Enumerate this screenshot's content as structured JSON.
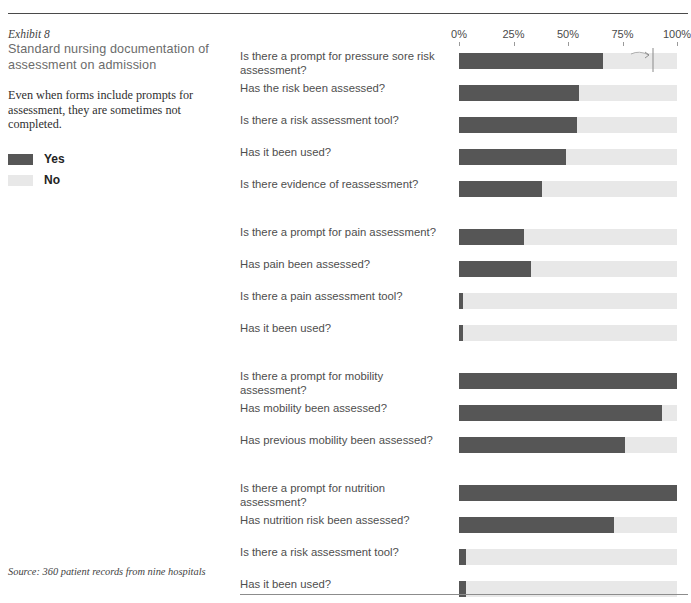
{
  "exhibit": {
    "label": "Exhibit 8",
    "title": "Standard nursing documentation of assessment on admission",
    "description": "Even when forms include prompts for assessment, they are sometimes not completed."
  },
  "legend": {
    "items": [
      {
        "label": "Yes",
        "color": "#565656"
      },
      {
        "label": "No",
        "color": "#e8e8e8"
      }
    ]
  },
  "source": "Source: 360 patient records from nine hospitals",
  "colors": {
    "yes": "#565656",
    "no": "#e8e8e8",
    "rule": "#4a4a4a",
    "label_text": "#4e4e4e",
    "title_text": "#6b6b6b"
  },
  "chart_data": {
    "type": "bar",
    "orientation": "horizontal",
    "stacked": true,
    "title": "Standard nursing documentation of assessment on admission",
    "xlabel": "",
    "ylabel": "",
    "xlim": [
      0,
      100
    ],
    "grid": false,
    "legend_position": "left-panel",
    "tick_labels": [
      "0%",
      "25%",
      "50%",
      "75%",
      "100%"
    ],
    "tick_values": [
      0,
      25,
      50,
      75,
      100
    ],
    "series": [
      {
        "name": "Yes",
        "color": "#565656"
      },
      {
        "name": "No",
        "color": "#e8e8e8"
      }
    ],
    "groups": [
      {
        "name": "Pressure sore",
        "rows": [
          {
            "category": "Is there a prompt for pressure sore risk assessment?",
            "yes": 66,
            "no": 34
          },
          {
            "category": "Has the risk been assessed?",
            "yes": 55,
            "no": 45
          },
          {
            "category": "Is there a risk assessment tool?",
            "yes": 54,
            "no": 46
          },
          {
            "category": "Has it been used?",
            "yes": 49,
            "no": 51
          },
          {
            "category": "Is there evidence of reassessment?",
            "yes": 38,
            "no": 62
          }
        ]
      },
      {
        "name": "Pain",
        "rows": [
          {
            "category": "Is there a prompt for pain assessment?",
            "yes": 30,
            "no": 70
          },
          {
            "category": "Has pain been assessed?",
            "yes": 33,
            "no": 67
          },
          {
            "category": "Is there a pain assessment tool?",
            "yes": 2,
            "no": 98
          },
          {
            "category": "Has it been used?",
            "yes": 2,
            "no": 98
          }
        ]
      },
      {
        "name": "Mobility",
        "rows": [
          {
            "category": "Is there a prompt for mobility assessment?",
            "yes": 100,
            "no": 0
          },
          {
            "category": "Has mobility been assessed?",
            "yes": 93,
            "no": 7
          },
          {
            "category": "Has previous mobility been assessed?",
            "yes": 76,
            "no": 24
          }
        ]
      },
      {
        "name": "Nutrition",
        "rows": [
          {
            "category": "Is there a prompt for nutrition assessment?",
            "yes": 100,
            "no": 0
          },
          {
            "category": "Has nutrition risk been assessed?",
            "yes": 71,
            "no": 29
          },
          {
            "category": "Is there a risk assessment tool?",
            "yes": 3,
            "no": 97
          },
          {
            "category": "Has it been used?",
            "yes": 3,
            "no": 97
          }
        ]
      }
    ]
  }
}
